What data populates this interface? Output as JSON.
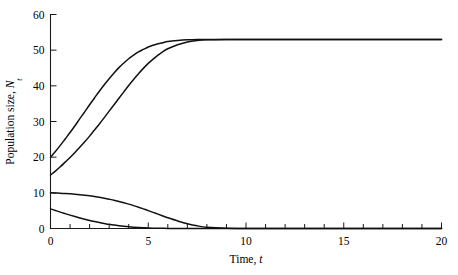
{
  "chart_data": {
    "type": "line",
    "title": "",
    "subtitle": "",
    "xlabel_text": "Time,",
    "xlabel_symbol": "t",
    "ylabel_text": "Population size,",
    "ylabel_symbol": "N",
    "ylabel_subscript": "t",
    "xlim": [
      0,
      20
    ],
    "ylim": [
      0,
      60
    ],
    "x_ticks_major": [
      0,
      5,
      10,
      15,
      20
    ],
    "x_ticks_minor_step": 1,
    "x_tick_labels": [
      "0",
      "5",
      "10",
      "15",
      "20"
    ],
    "y_ticks_major": [
      0,
      10,
      20,
      30,
      40,
      50,
      60
    ],
    "y_tick_labels": [
      "0",
      "10",
      "20",
      "30",
      "40",
      "50",
      "60"
    ],
    "grid": false,
    "legend": false,
    "legend_position": "none",
    "carrying_capacity": 53,
    "line_color": "#111111",
    "axis_color": "#1a1a1a",
    "background_color": "#ffffff",
    "x": [
      0,
      0.25,
      0.5,
      0.75,
      1,
      1.25,
      1.5,
      1.75,
      2,
      2.25,
      2.5,
      2.75,
      3,
      3.25,
      3.5,
      3.75,
      4,
      4.25,
      4.5,
      4.75,
      5,
      5.25,
      5.5,
      5.75,
      6,
      6.5,
      7,
      7.5,
      8,
      9,
      10,
      11,
      12,
      13,
      14,
      15,
      16,
      17,
      18,
      19,
      20
    ],
    "series": [
      {
        "name": "N0 = 20",
        "initial_value": 20,
        "final_value": 53,
        "values": [
          20.0,
          21.6,
          23.3,
          25.1,
          26.9,
          28.8,
          30.8,
          32.7,
          34.7,
          36.6,
          38.5,
          40.3,
          42.0,
          43.6,
          45.1,
          46.4,
          47.6,
          48.6,
          49.5,
          50.2,
          50.9,
          51.4,
          51.8,
          52.1,
          52.4,
          52.7,
          52.9,
          53.0,
          53.0,
          53.0,
          53.0,
          53.0,
          53.0,
          53.0,
          53.0,
          53.0,
          53.0,
          53.0,
          53.0,
          53.0,
          53.0
        ]
      },
      {
        "name": "N0 = 15",
        "initial_value": 15,
        "final_value": 53,
        "values": [
          15.0,
          16.1,
          17.3,
          18.6,
          19.9,
          21.3,
          22.8,
          24.3,
          25.9,
          27.6,
          29.3,
          31.1,
          32.9,
          34.7,
          36.5,
          38.3,
          40.1,
          41.8,
          43.4,
          44.9,
          46.3,
          47.5,
          48.6,
          49.6,
          50.4,
          51.5,
          52.3,
          52.7,
          52.9,
          53.0,
          53.0,
          53.0,
          53.0,
          53.0,
          53.0,
          53.0,
          53.0,
          53.0,
          53.0,
          53.0,
          53.0
        ]
      },
      {
        "name": "N0 = 10",
        "initial_value": 10,
        "final_value": 0,
        "values": [
          10.0,
          9.95,
          9.9,
          9.82,
          9.73,
          9.62,
          9.49,
          9.34,
          9.17,
          8.97,
          8.75,
          8.5,
          8.22,
          7.92,
          7.58,
          7.22,
          6.83,
          6.41,
          5.97,
          5.5,
          5.02,
          4.52,
          4.02,
          3.52,
          3.03,
          2.12,
          1.35,
          0.75,
          0.35,
          0.05,
          0.0,
          0.0,
          0.0,
          0.0,
          0.0,
          0.0,
          0.0,
          0.0,
          0.0,
          0.0,
          0.0
        ]
      },
      {
        "name": "N0 = 5.5",
        "initial_value": 5.5,
        "final_value": 0,
        "values": [
          5.5,
          5.05,
          4.6,
          4.17,
          3.75,
          3.35,
          2.96,
          2.6,
          2.26,
          1.95,
          1.66,
          1.4,
          1.16,
          0.95,
          0.77,
          0.61,
          0.47,
          0.36,
          0.27,
          0.2,
          0.14,
          0.1,
          0.07,
          0.05,
          0.03,
          0.01,
          0.0,
          0.0,
          0.0,
          0.0,
          0.0,
          0.0,
          0.0,
          0.0,
          0.0,
          0.0,
          0.0,
          0.0,
          0.0,
          0.0,
          0.0
        ]
      }
    ]
  }
}
